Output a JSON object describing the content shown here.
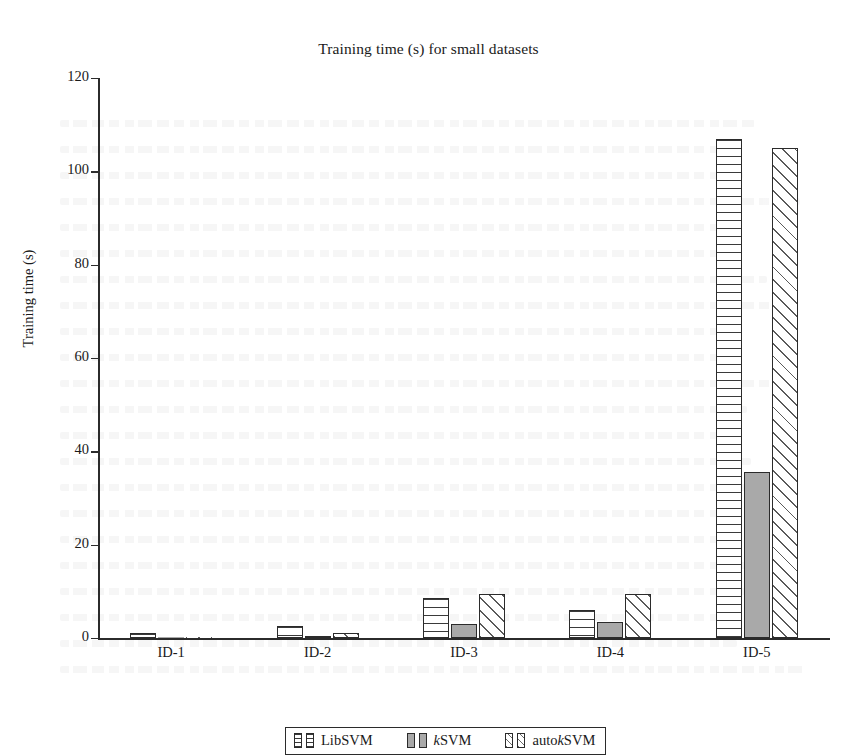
{
  "chart_data": {
    "type": "bar",
    "title": "Training time (s) for small datasets",
    "xlabel": "",
    "ylabel": "Training time (s)",
    "ylim": [
      0,
      120
    ],
    "ytick_step": 20,
    "yticks": [
      0,
      20,
      40,
      60,
      80,
      100,
      120
    ],
    "grid": false,
    "legend_position": "bottom-center",
    "categories": [
      "ID-1",
      "ID-2",
      "ID-3",
      "ID-4",
      "ID-5"
    ],
    "series": [
      {
        "name": "LibSVM",
        "pattern": "horizontal-stripes",
        "values": [
          1.0,
          2.5,
          8.5,
          6.0,
          107.0
        ]
      },
      {
        "name": "kSVM",
        "pattern": "solid-gray",
        "values": [
          0.2,
          0.4,
          3.0,
          3.5,
          35.5
        ]
      },
      {
        "name": "autokSVM",
        "pattern": "diagonal-hatch",
        "values": [
          0.2,
          1.0,
          9.5,
          9.5,
          105.0
        ]
      }
    ]
  },
  "legend": {
    "items": [
      {
        "prefix": "",
        "emphasis": "",
        "suffix": "LibSVM"
      },
      {
        "prefix": "",
        "emphasis": "k",
        "suffix": "SVM"
      },
      {
        "prefix": "auto",
        "emphasis": "k",
        "suffix": "SVM"
      }
    ]
  },
  "colors": {
    "axis": "#2b2b2b",
    "gray_fill": "#a9a9a9",
    "stripe": "#3a3a3a",
    "hatch": "#5a5a5a",
    "background": "#ffffff"
  }
}
